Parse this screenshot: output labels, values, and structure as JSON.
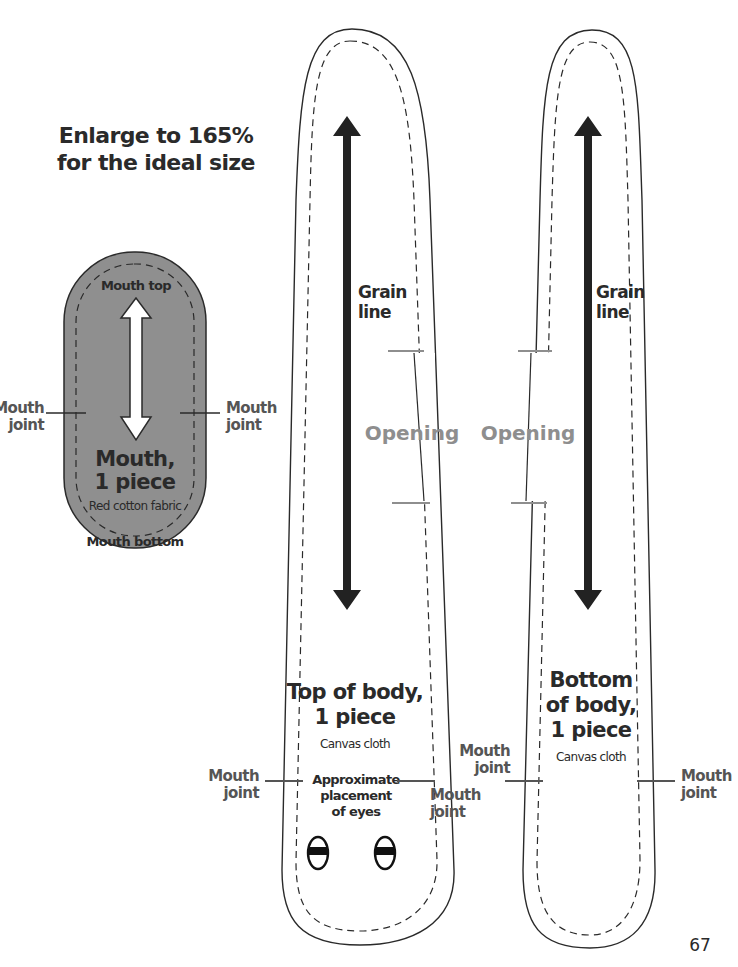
{
  "header": {
    "instruction_line1": "Enlarge to 165%",
    "instruction_line2": "for the ideal size"
  },
  "mouth_piece": {
    "top_label": "Mouth top",
    "title_line1": "Mouth,",
    "title_line2": "1 piece",
    "material": "Red cotton fabric",
    "bottom_label": "Mouth bottom",
    "left_joint_line1": "Mouth",
    "left_joint_line2": "joint",
    "right_joint_line1": "Mouth",
    "right_joint_line2": "joint",
    "fill_color": "#8f8f8f"
  },
  "top_body_piece": {
    "grain_line1": "Grain",
    "grain_line2": "line",
    "opening_label": "Opening",
    "title_line1": "Top of body,",
    "title_line2": "1 piece",
    "material": "Canvas cloth",
    "eyes_line1": "Approximate",
    "eyes_line2": "placement",
    "eyes_line3": "of eyes",
    "left_joint_line1": "Mouth",
    "left_joint_line2": "joint",
    "right_joint_line1": "Mouth",
    "right_joint_line2": "joint"
  },
  "bottom_body_piece": {
    "grain_line1": "Grain",
    "grain_line2": "line",
    "opening_label": "Opening",
    "title_line1": "Bottom",
    "title_line2": "of body,",
    "title_line3": "1 piece",
    "material": "Canvas cloth",
    "left_joint_line1": "Mouth",
    "left_joint_line2": "joint",
    "right_joint_line1": "Mouth",
    "right_joint_line2": "joint"
  },
  "footer": {
    "page_number": "67"
  },
  "colors": {
    "ink": "#2a2a2a",
    "opening_gray": "#8e8e8e",
    "mouth_fill": "#8f8f8f"
  }
}
